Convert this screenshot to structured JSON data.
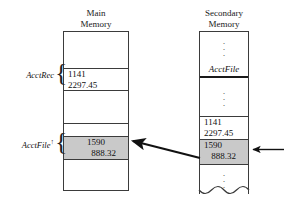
{
  "figure": {
    "columns": {
      "main": {
        "title": "Main\nMemory",
        "cells": {
          "acctrec_key": "1141",
          "acctrec_amount": "2297.45",
          "acctfile_key": "1590",
          "acctfile_amount": "888.32"
        },
        "labels": {
          "acctrec": "AcctRec",
          "acctfile_ptr": "AcctFile",
          "acctfile_ptr_caret": "↑",
          "brace": "{"
        }
      },
      "secondary": {
        "title": "Secondary\nMemory",
        "cells": {
          "file_name": "AcctFile",
          "rec1_key": "1141",
          "rec1_amount": "2297.45",
          "rec2_key": "1590",
          "rec2_amount": "888.32"
        },
        "ellipsis": "·"
      }
    },
    "arrows": {
      "transfer": "transfer-arrow",
      "file_position": "file-position-arrow"
    },
    "colors": {
      "shaded_cell": "#c9c9c9",
      "rule": "#3b3b3b",
      "text": "#111111"
    }
  }
}
